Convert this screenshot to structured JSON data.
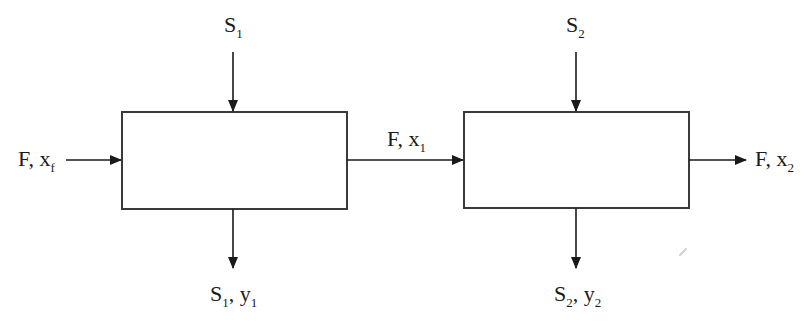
{
  "diagram": {
    "type": "two-stage flowsheet",
    "colors": {
      "stroke": "#3a3a3a",
      "text": "#1a1a1a",
      "background": "#ffffff"
    },
    "units": [
      {
        "id": "stage-1",
        "x": 122,
        "y": 112,
        "width": 225,
        "height": 97
      },
      {
        "id": "stage-2",
        "x": 464,
        "y": 112,
        "width": 225,
        "height": 96
      }
    ],
    "streams": {
      "feed": {
        "main": "F, x",
        "sub": "f"
      },
      "solvent_1_in": {
        "main": "S",
        "sub": "1"
      },
      "intermediate": {
        "main": "F, x",
        "sub": "1"
      },
      "extract_1": {
        "main1": "S",
        "sub1": "1",
        "main2": ", y",
        "sub2": "1"
      },
      "solvent_2_in": {
        "main": "S",
        "sub": "2"
      },
      "product": {
        "main": "F, x",
        "sub": "2"
      },
      "extract_2": {
        "main1": "S",
        "sub1": "2",
        "main2": ", y",
        "sub2": "2"
      }
    }
  }
}
